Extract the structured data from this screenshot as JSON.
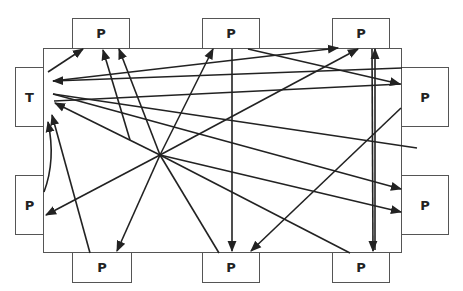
{
  "diagram": {
    "table": {
      "x": 43,
      "y": 48,
      "w": 359,
      "h": 205
    },
    "colors": {
      "line": "#222222",
      "border": "#555555",
      "background": "#ffffff"
    },
    "nodes": [
      {
        "id": "p-top-1",
        "label": "P",
        "x": 72,
        "y": 18,
        "w": 58,
        "h": 31
      },
      {
        "id": "p-top-2",
        "label": "P",
        "x": 202,
        "y": 18,
        "w": 58,
        "h": 31
      },
      {
        "id": "p-top-3",
        "label": "P",
        "x": 332,
        "y": 18,
        "w": 58,
        "h": 31
      },
      {
        "id": "teacher",
        "label": "T",
        "x": 15,
        "y": 67,
        "w": 29,
        "h": 60
      },
      {
        "id": "p-left",
        "label": "P",
        "x": 15,
        "y": 175,
        "w": 29,
        "h": 60
      },
      {
        "id": "p-right-1",
        "label": "P",
        "x": 401,
        "y": 67,
        "w": 48,
        "h": 60
      },
      {
        "id": "p-right-2",
        "label": "P",
        "x": 401,
        "y": 175,
        "w": 48,
        "h": 60
      },
      {
        "id": "p-bottom-1",
        "label": "P",
        "x": 72,
        "y": 252,
        "w": 60,
        "h": 31
      },
      {
        "id": "p-bottom-2",
        "label": "P",
        "x": 202,
        "y": 252,
        "w": 58,
        "h": 31
      },
      {
        "id": "p-bottom-3",
        "label": "P",
        "x": 332,
        "y": 252,
        "w": 58,
        "h": 31
      }
    ],
    "arrows": [
      {
        "from": [
          48,
          72
        ],
        "to": [
          83,
          49
        ],
        "head": true
      },
      {
        "from": [
          130,
          140
        ],
        "to": [
          103,
          50
        ],
        "head": true
      },
      {
        "from": [
          160,
          155
        ],
        "to": [
          119,
          49
        ],
        "head": true
      },
      {
        "from": [
          160,
          155
        ],
        "to": [
          213,
          49
        ],
        "head": true
      },
      {
        "from": [
          402,
          68
        ],
        "to": [
          53,
          81
        ],
        "head": true
      },
      {
        "from": [
          53,
          94
        ],
        "to": [
          417,
          148
        ],
        "head": false
      },
      {
        "from": [
          232,
          49
        ],
        "to": [
          232,
          251
        ],
        "head": true
      },
      {
        "from": [
          248,
          49
        ],
        "to": [
          400,
          84
        ],
        "head": true
      },
      {
        "from": [
          53,
          81
        ],
        "to": [
          338,
          48
        ],
        "head": true
      },
      {
        "from": [
          160,
          155
        ],
        "to": [
          358,
          49
        ],
        "head": true
      },
      {
        "from": [
          375,
          250
        ],
        "to": [
          375,
          49
        ],
        "head": true
      },
      {
        "from": [
          372,
          49
        ],
        "to": [
          373,
          251
        ],
        "head": true
      },
      {
        "from": [
          401,
          108
        ],
        "to": [
          251,
          251
        ],
        "head": true
      },
      {
        "from": [
          401,
          84
        ],
        "to": [
          54,
          101
        ],
        "head": false
      },
      {
        "from": [
          53,
          94
        ],
        "to": [
          401,
          189
        ],
        "head": true
      },
      {
        "from": [
          160,
          155
        ],
        "to": [
          401,
          212
        ],
        "head": true
      },
      {
        "from": [
          160,
          155
        ],
        "to": [
          55,
          103
        ],
        "head": true
      },
      {
        "from": [
          160,
          155
        ],
        "to": [
          46,
          215
        ],
        "head": true
      },
      {
        "from": [
          160,
          155
        ],
        "to": [
          117,
          251
        ],
        "head": true
      },
      {
        "from": [
          160,
          155
        ],
        "to": [
          219,
          253
        ],
        "head": false
      },
      {
        "from": [
          350,
          253
        ],
        "to": [
          160,
          155
        ],
        "head": false
      },
      {
        "from": [
          90,
          253
        ],
        "to": [
          52,
          115
        ],
        "head": true
      }
    ],
    "curve": {
      "d": "M 44 192 Q 56 160 48 122",
      "head": true
    }
  }
}
